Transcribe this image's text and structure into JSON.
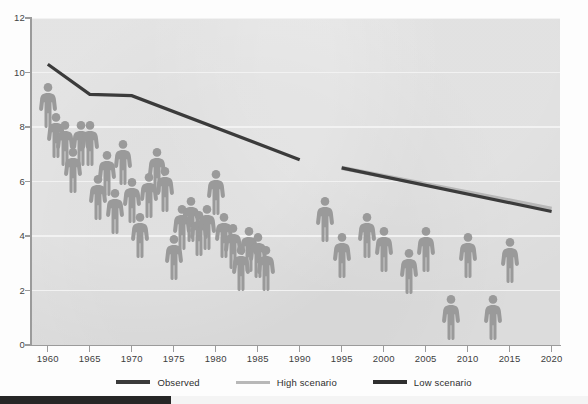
{
  "chart_data": {
    "type": "scatter",
    "title": "",
    "subtitle": "",
    "xlabel": "",
    "ylabel": "",
    "xlim": [
      1958,
      2021
    ],
    "ylim": [
      0,
      12
    ],
    "yticks": [
      0,
      2,
      4,
      6,
      8,
      10,
      12
    ],
    "xticks": [
      1960,
      1965,
      1970,
      1975,
      1980,
      1985,
      1990,
      1995,
      2000,
      2005,
      2010,
      2015,
      2020
    ],
    "grid": true,
    "legend_position": "bottom",
    "pictogram_marker": "person-figure",
    "series": [
      {
        "name": "Observed",
        "type": "line",
        "color": "#3b3b3b",
        "x": [
          1960,
          1965,
          1970,
          1990
        ],
        "values": [
          10.3,
          9.2,
          9.15,
          6.8
        ]
      },
      {
        "name": "High scenario",
        "type": "line",
        "color": "#b7b7b7",
        "x": [
          1995,
          2020
        ],
        "values": [
          6.5,
          5.0
        ]
      },
      {
        "name": "Low scenario",
        "type": "line",
        "color": "#3b3b3b",
        "x": [
          1995,
          2020
        ],
        "values": [
          6.5,
          4.9
        ]
      },
      {
        "name": "Annual data points",
        "type": "pictogram",
        "color": "#9a9a9a",
        "x": [
          1960,
          1961,
          1962,
          1963,
          1964,
          1965,
          1966,
          1967,
          1968,
          1969,
          1970,
          1971,
          1972,
          1973,
          1974,
          1975,
          1976,
          1977,
          1978,
          1979,
          1980,
          1981,
          1982,
          1983,
          1984,
          1985,
          1986,
          1993,
          1995,
          1998,
          2000,
          2003,
          2005,
          2008,
          2010,
          2013,
          2015
        ],
        "values": [
          9.5,
          8.4,
          8.1,
          7.1,
          8.1,
          8.1,
          6.1,
          7.0,
          5.6,
          7.4,
          6.0,
          4.7,
          6.2,
          7.1,
          6.4,
          3.9,
          5.0,
          5.3,
          4.8,
          5.0,
          6.3,
          4.7,
          4.3,
          3.5,
          4.2,
          4.0,
          3.5,
          5.3,
          4.0,
          4.7,
          4.2,
          3.4,
          4.2,
          1.7,
          4.0,
          1.7,
          3.8
        ]
      }
    ]
  },
  "axes": {
    "y_labels": [
      "12",
      "10",
      "8",
      "6",
      "4",
      "2",
      "0"
    ],
    "x_labels": [
      "1960",
      "1965",
      "1970",
      "1975",
      "1980",
      "1985",
      "1990",
      "1995",
      "2000",
      "2005",
      "2010",
      "2015",
      "2020"
    ]
  },
  "legend": {
    "items": [
      {
        "label": "Observed",
        "color": "#3b3b3b"
      },
      {
        "label": "High scenario",
        "color": "#b8b8b8"
      },
      {
        "label": "Low scenario",
        "color": "#2f2f2f"
      }
    ]
  },
  "colors": {
    "plot_background": "#dcdcdc",
    "gridline": "#f2f2f2",
    "figure": "#9a9a9a",
    "observed_line": "#3b3b3b",
    "high_scenario_line": "#b8b8b8",
    "low_scenario_line": "#2f2f2f",
    "axis": "#9b9b9b",
    "page_background": "#fdfdfd",
    "bottom_progress": "#262626"
  },
  "bottom_bar": {
    "progress_width_px": 171
  }
}
